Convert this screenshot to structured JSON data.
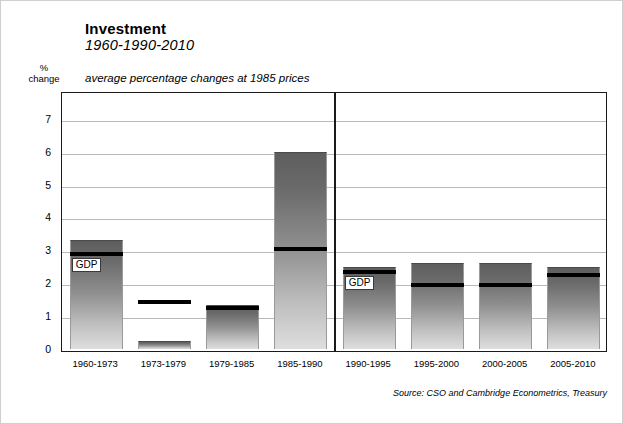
{
  "header": {
    "title": "Investment",
    "subtitle_years": "1960-1990-2010",
    "caption": "average percentage changes at 1985 prices"
  },
  "yaxis_caption_line1": "%",
  "yaxis_caption_line2": "change",
  "source_note": "Source: CSO and Cambridge Econometrics, Treasury",
  "gdp_label": "GDP",
  "chart_data": {
    "type": "bar",
    "title": "Investment 1960-1990-2010",
    "subtitle": "average percentage changes at 1985 prices",
    "xlabel": "",
    "ylabel": "% change",
    "ylim": [
      0,
      7.6
    ],
    "yticks": [
      "0",
      "1",
      "2",
      "3",
      "4",
      "5",
      "6",
      "7"
    ],
    "ytick_values": [
      0,
      1,
      2,
      3,
      4,
      5,
      6,
      7
    ],
    "grid": true,
    "legend": "GDP",
    "divider_after_category": "1985-1990",
    "categories": [
      "1960-1973",
      "1973-1979",
      "1979-1985",
      "1985-1990",
      "1990-1995",
      "1995-2000",
      "2000-2005",
      "2005-2010"
    ],
    "series": [
      {
        "name": "Investment",
        "values": [
          3.3,
          0.25,
          1.35,
          6.0,
          2.5,
          2.6,
          2.6,
          2.5
        ]
      },
      {
        "name": "GDP",
        "values": [
          2.95,
          1.5,
          1.3,
          3.1,
          2.4,
          2.0,
          2.0,
          2.3
        ]
      }
    ],
    "gdp_labelled_bars": [
      "1960-1973",
      "1990-1995"
    ],
    "colors": {
      "bar_top": "#5e5e5e",
      "bar_bottom": "#dedede",
      "gdp_line": "#000000",
      "gridline": "#b9b9b9",
      "axis": "#1a1a1a"
    }
  }
}
